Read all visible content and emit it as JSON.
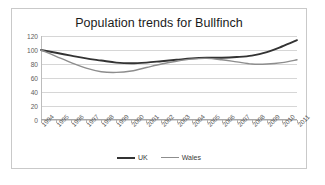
{
  "chart_data": {
    "type": "line",
    "title": "Population trends for Bullfinch",
    "xlabel": "",
    "ylabel": "",
    "ylim": [
      0,
      120
    ],
    "yticks": [
      0,
      20,
      40,
      60,
      80,
      100,
      120
    ],
    "grid": true,
    "legend_position": "bottom",
    "categories": [
      "1994",
      "1995",
      "1996",
      "1997",
      "1998",
      "1999",
      "2000",
      "2001",
      "2002",
      "2003",
      "2004",
      "2005",
      "2006",
      "2007",
      "2008",
      "2009",
      "2010",
      "2011"
    ],
    "series": [
      {
        "name": "UK",
        "color": "#333333",
        "values": [
          100,
          96,
          92,
          88,
          85,
          82,
          81,
          82,
          84,
          86,
          88,
          89,
          89,
          90,
          92,
          97,
          105,
          114
        ]
      },
      {
        "name": "Wales",
        "color": "#8d8d8d",
        "values": [
          100,
          91,
          82,
          74,
          69,
          68,
          70,
          75,
          80,
          84,
          87,
          88,
          86,
          83,
          80,
          80,
          82,
          86
        ]
      }
    ]
  }
}
